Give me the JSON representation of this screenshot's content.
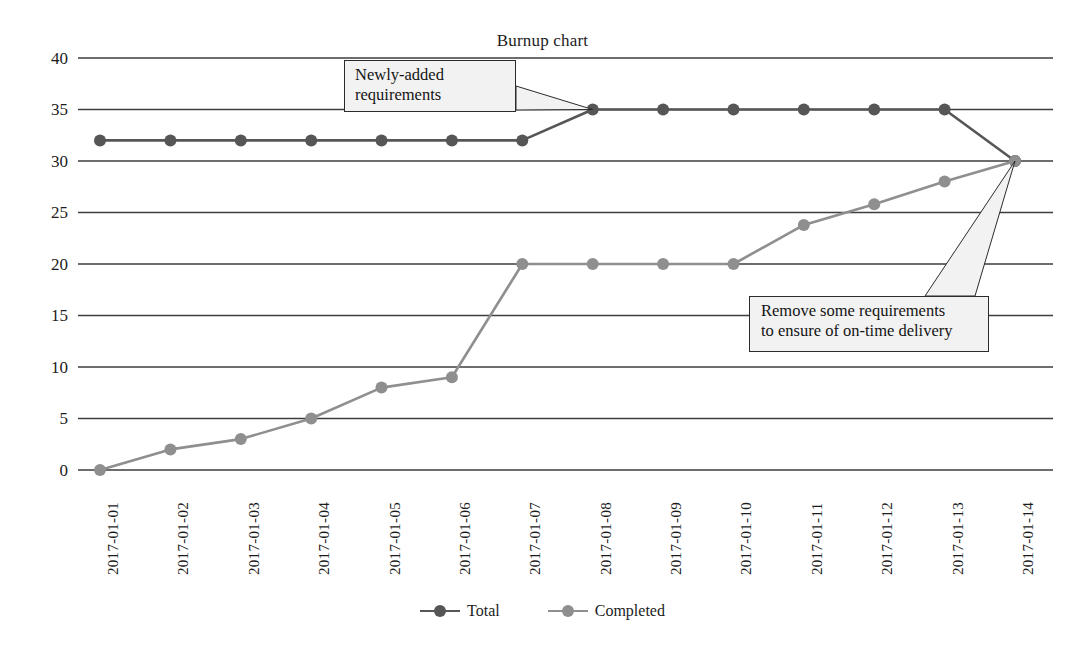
{
  "chart_data": {
    "type": "line",
    "title": "Burnup chart",
    "xlabel": "",
    "ylabel": "",
    "ylim": [
      0,
      40
    ],
    "yticks": [
      0,
      5,
      10,
      15,
      20,
      25,
      30,
      35,
      40
    ],
    "grid": true,
    "legend_position": "bottom",
    "categories": [
      "2017-01-01",
      "2017-01-02",
      "2017-01-03",
      "2017-01-04",
      "2017-01-05",
      "2017-01-06",
      "2017-01-07",
      "2017-01-08",
      "2017-01-09",
      "2017-01-10",
      "2017-01-11",
      "2017-01-12",
      "2017-01-13",
      "2017-01-14"
    ],
    "series": [
      {
        "name": "Total",
        "color": "#565656",
        "values": [
          32,
          32,
          32,
          32,
          32,
          32,
          32,
          35,
          35,
          35,
          35,
          35,
          35,
          30
        ]
      },
      {
        "name": "Completed",
        "color": "#8f8f8f",
        "values": [
          0,
          2,
          3,
          5,
          8,
          9,
          20,
          20,
          20,
          20,
          23.8,
          25.8,
          28,
          30
        ]
      }
    ],
    "annotations": [
      {
        "id": "newly-added",
        "text": "Newly-added requirements",
        "lines": [
          "Newly-added",
          "requirements"
        ],
        "points_to_category": "2017-01-08",
        "points_to_value": 35
      },
      {
        "id": "remove-requirements",
        "text": "Remove some requirements to ensure of on-time delivery",
        "lines": [
          "Remove some requirements",
          "to ensure of on-time delivery"
        ],
        "points_to_category": "2017-01-14",
        "points_to_value": 30
      }
    ]
  },
  "colors": {
    "total": "#565656",
    "completed": "#8f8f8f",
    "gridline": "#3d3d3d",
    "callout_fill": "#f2f2f2",
    "callout_border": "#2b2b2b",
    "text": "#1c1c1c"
  }
}
